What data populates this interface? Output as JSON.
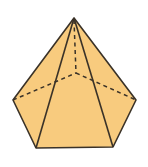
{
  "figure": {
    "shape": "pentagonal-pyramid",
    "fill_color": "#F8CB7E",
    "stroke_color": "#3a3228",
    "background": "#ffffff",
    "apex": [
      74,
      18
    ],
    "base_vertices": {
      "left": [
        13,
        100
      ],
      "front_left": [
        36,
        148
      ],
      "front_right": [
        113,
        147
      ],
      "right": [
        136,
        100
      ],
      "back": [
        76,
        73
      ]
    }
  }
}
